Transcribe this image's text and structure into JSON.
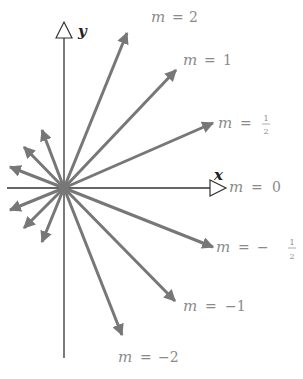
{
  "diagram": {
    "origin": [
      64,
      188
    ],
    "axis_color": "#333333",
    "arrow_color": "#777777",
    "axes": {
      "x": {
        "label": "x",
        "from": [
          7,
          188
        ],
        "to": [
          224,
          188
        ]
      },
      "y": {
        "label": "y",
        "from": [
          64,
          358
        ],
        "to": [
          64,
          24
        ]
      }
    },
    "labeled_arrows": [
      {
        "slope": "2",
        "label_m": "m",
        "label_eq": "=",
        "label_val": "2",
        "tip": [
          127,
          33
        ]
      },
      {
        "slope": "1",
        "label_m": "m",
        "label_eq": "=",
        "label_val": "1",
        "tip": [
          176,
          70
        ]
      },
      {
        "slope": "1/2",
        "label_m": "m",
        "label_eq": "=",
        "label_num": "1",
        "label_den": "2",
        "tip": [
          213,
          123
        ]
      },
      {
        "slope": "0",
        "label_m": "m",
        "label_eq": "=",
        "label_val": "0"
      },
      {
        "slope": "-1/2",
        "label_m": "m",
        "label_eq": "=",
        "label_sign": "−",
        "label_num": "1",
        "label_den": "2",
        "tip": [
          213,
          247
        ]
      },
      {
        "slope": "-1",
        "label_m": "m",
        "label_eq": "=",
        "label_val": "−1",
        "tip": [
          175,
          301
        ]
      },
      {
        "slope": "-2",
        "label_m": "m",
        "label_eq": "=",
        "label_val": "−2",
        "tip": [
          122,
          335
        ]
      }
    ],
    "unlabeled_arrows": [
      {
        "tip": [
          42,
          130
        ]
      },
      {
        "tip": [
          24,
          147
        ]
      },
      {
        "tip": [
          10,
          167
        ]
      },
      {
        "tip": [
          10,
          210
        ]
      },
      {
        "tip": [
          24,
          228
        ]
      },
      {
        "tip": [
          42,
          242
        ]
      }
    ]
  }
}
